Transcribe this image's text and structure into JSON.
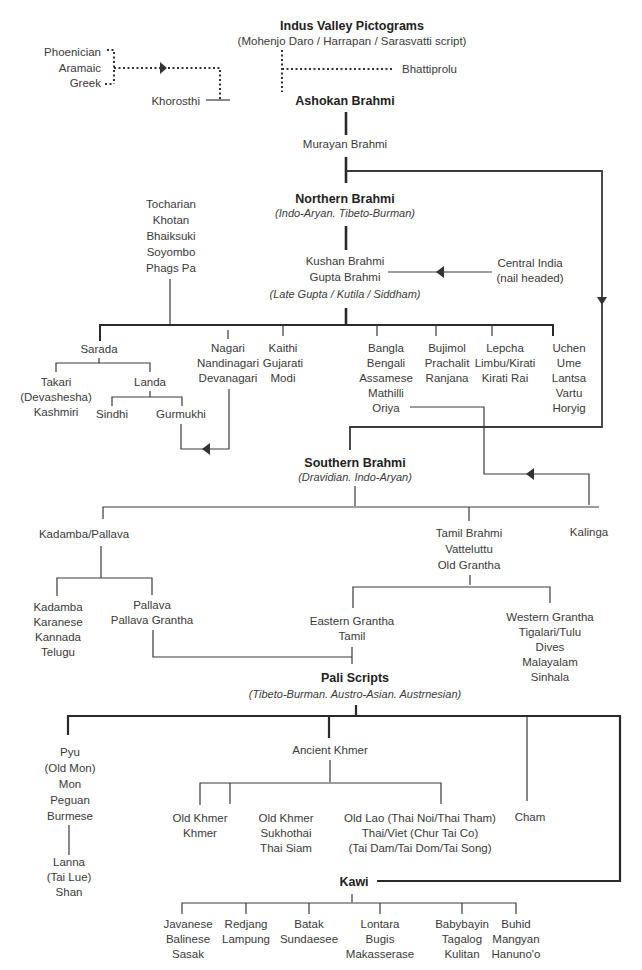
{
  "diagram": {
    "root": {
      "title": "Indus Valley Pictograms",
      "subtitle": "(Mohenjo Daro / Harrapan / Sarasvatti script)"
    },
    "western": [
      "Phoenician",
      "Aramaic",
      "Greek"
    ],
    "bhattiprolu": "Bhattiprolu",
    "khorosthi": "Khorosthi",
    "ashokan": "Ashokan Brahmi",
    "murayan": "Murayan Brahmi",
    "northern": {
      "title": "Northern Brahmi",
      "subtitle": "(Indo-Aryan. Tibeto-Burman)"
    },
    "tocharian": [
      "Tocharian",
      "Khotan",
      "Bhaiksuki",
      "Soyombo",
      "Phags Pa"
    ],
    "kushan": [
      "Kushan Brahmi",
      "Gupta Brahmi"
    ],
    "kushan_sub": "(Late Gupta / Kutila / Siddham)",
    "central_india": [
      "Central India",
      "(nail headed)"
    ],
    "north_children": {
      "sarada": "Sarada",
      "takari": [
        "Takari",
        "(Devashesha)",
        "Kashmiri"
      ],
      "landa": "Landa",
      "sindhi": "Sindhi",
      "gurmukhi": "Gurmukhi",
      "nagari": [
        "Nagari",
        "Nandinagari",
        "Devanagari"
      ],
      "kaithi": [
        "Kaithi",
        "Gujarati",
        "Modi"
      ],
      "bangla": [
        "Bangla",
        "Bengali",
        "Assamese",
        "Mathilli",
        "Oriya"
      ],
      "bujimol": [
        "Bujimol",
        "Prachalit",
        "Ranjana"
      ],
      "lepcha": [
        "Lepcha",
        "Limbu/Kirati",
        "Kirati Rai"
      ],
      "uchen": [
        "Uchen",
        "Ume",
        "Lantsa",
        "Vartu",
        "Horyig"
      ]
    },
    "southern": {
      "title": "Southern Brahmi",
      "subtitle": "(Dravidian. Indo-Aryan)"
    },
    "kadamba_pallava": "Kadamba/Pallava",
    "tamil_brahmi": [
      "Tamil Brahmi",
      "Vatteluttu",
      "Old Grantha"
    ],
    "kalinga": "Kalinga",
    "kadamba": [
      "Kadamba",
      "Karanese",
      "Kannada",
      "Telugu"
    ],
    "pallava": [
      "Pallava",
      "Pallava Grantha"
    ],
    "eastern_grantha": [
      "Eastern Grantha",
      "Tamil"
    ],
    "western_grantha": [
      "Western Grantha",
      "Tigalari/Tulu",
      "Dives",
      "Malayalam",
      "Sinhala"
    ],
    "pali": {
      "title": "Pali Scripts",
      "subtitle": "(Tibeto-Burman. Austro-Asian. Austrnesian)"
    },
    "pyu": [
      "Pyu",
      "(Old Mon)",
      "Mon",
      "Peguan",
      "Burmese"
    ],
    "lanna": [
      "Lanna",
      "(Tai Lue)",
      "Shan"
    ],
    "ancient_khmer": "Ancient Khmer",
    "old_khmer_1": [
      "Old Khmer",
      "Khmer"
    ],
    "old_khmer_2": [
      "Old Khmer",
      "Sukhothai",
      "Thai Siam"
    ],
    "old_lao": [
      "Old Lao (Thai Noi/Thai Tham)",
      "Thai/Viet (Chur Tai Co)",
      "(Tai Dam/Tai Dom/Tai Song)"
    ],
    "cham": "Cham",
    "kawi": "Kawi",
    "kawi_children": {
      "javanese": [
        "Javanese",
        "Balinese",
        "Sasak"
      ],
      "redjang": [
        "Redjang",
        "Lampung"
      ],
      "batak": [
        "Batak",
        "Sundaesee"
      ],
      "lontara": [
        "Lontara",
        "Bugis",
        "Makasserase"
      ],
      "babybayin": [
        "Babybayin",
        "Tagalog",
        "Kulitan"
      ],
      "buhid": [
        "Buhid",
        "Mangyan",
        "Hanuno'o"
      ]
    }
  }
}
